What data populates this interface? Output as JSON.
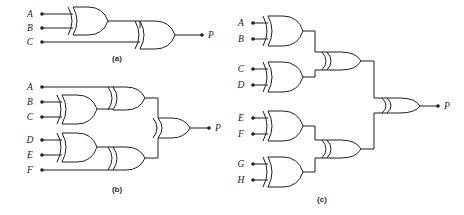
{
  "figure": {
    "background_color": "#ffffff",
    "line_color": "#1f1f1f",
    "panels": [
      {
        "id": "a",
        "caption": "(a)",
        "gate_type": "xor-gate",
        "inputs": [
          "A",
          "B",
          "C"
        ],
        "output": "P",
        "gates": [
          {
            "name": "gate-a1",
            "type": "xor-gate",
            "inputs": [
              "A",
              "B"
            ]
          },
          {
            "name": "gate-a2",
            "type": "xor-gate",
            "inputs": [
              "gate-a1",
              "C"
            ]
          }
        ]
      },
      {
        "id": "b",
        "caption": "(b)",
        "gate_type": "xor-gate",
        "inputs": [
          "A",
          "B",
          "C",
          "D",
          "E",
          "F"
        ],
        "output": "P",
        "gates": [
          {
            "name": "gate-b1",
            "type": "xor-gate",
            "inputs": [
              "B",
              "C"
            ]
          },
          {
            "name": "gate-b2",
            "type": "xor-gate",
            "inputs": [
              "A",
              "gate-b1"
            ]
          },
          {
            "name": "gate-b3",
            "type": "xor-gate",
            "inputs": [
              "D",
              "E"
            ]
          },
          {
            "name": "gate-b4",
            "type": "xor-gate",
            "inputs": [
              "gate-b3",
              "F"
            ]
          },
          {
            "name": "gate-b5",
            "type": "xor-gate",
            "inputs": [
              "gate-b2",
              "gate-b4"
            ]
          }
        ]
      },
      {
        "id": "c",
        "caption": "(c)",
        "gate_type": "xor-gate",
        "inputs": [
          "A",
          "B",
          "C",
          "D",
          "E",
          "F",
          "G",
          "H"
        ],
        "output": "P",
        "gates": [
          {
            "name": "gate-c1",
            "type": "xor-gate",
            "inputs": [
              "A",
              "B"
            ]
          },
          {
            "name": "gate-c2",
            "type": "xor-gate",
            "inputs": [
              "C",
              "D"
            ]
          },
          {
            "name": "gate-c3",
            "type": "xor-gate",
            "inputs": [
              "E",
              "F"
            ]
          },
          {
            "name": "gate-c4",
            "type": "xor-gate",
            "inputs": [
              "G",
              "H"
            ]
          },
          {
            "name": "gate-c5",
            "type": "xor-gate",
            "inputs": [
              "gate-c1",
              "gate-c2"
            ]
          },
          {
            "name": "gate-c6",
            "type": "xor-gate",
            "inputs": [
              "gate-c3",
              "gate-c4"
            ]
          },
          {
            "name": "gate-c7",
            "type": "xor-gate",
            "inputs": [
              "gate-c5",
              "gate-c6"
            ]
          }
        ]
      }
    ]
  },
  "labels": {
    "panel_a": {
      "in1": "A",
      "in2": "B",
      "in3": "C",
      "out": "P",
      "caption": "(a)"
    },
    "panel_b": {
      "in1": "A",
      "in2": "B",
      "in3": "C",
      "in4": "D",
      "in5": "E",
      "in6": "F",
      "out": "P",
      "caption": "(b)"
    },
    "panel_c": {
      "in1": "A",
      "in2": "B",
      "in3": "C",
      "in4": "D",
      "in5": "E",
      "in6": "F",
      "in7": "G",
      "in8": "H",
      "out": "P",
      "caption": "(c)"
    }
  }
}
